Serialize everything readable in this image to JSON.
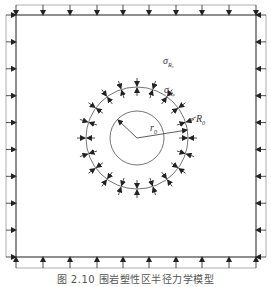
{
  "figure": {
    "caption": "图 2.10  围岩塑性区半径力学模型",
    "labels": {
      "sigma_r": "σ",
      "sigma_r_sub": "R₀",
      "sigma_rp": "σ",
      "sigma_rp_sub": "Rₚ",
      "R": "R",
      "R_sub": "0",
      "r": "r",
      "r_sub": "0"
    },
    "geometry": {
      "square": {
        "left": 16,
        "top": 15,
        "right": 256,
        "bottom": 257
      },
      "circle_center": [
        137,
        138
      ],
      "outer_radius": 51,
      "inner_radius": 27,
      "load_positions": [
        16,
        43,
        70,
        97,
        123,
        149,
        176,
        202,
        229,
        256
      ],
      "radial_arrow_count": 20
    },
    "colors": {
      "line": "#444444",
      "load_line": "#888888",
      "arrow": "#222222"
    }
  }
}
